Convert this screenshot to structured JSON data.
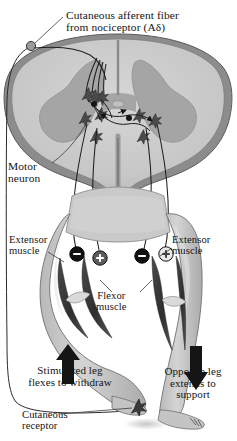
{
  "figure": {
    "background_color": "#ffffff"
  },
  "labels": {
    "afferent_fiber": "Cutaneous afferent fiber\nfrom nociceptor (Aδ)",
    "motor_neuron": "Motor\nneuron",
    "extensor_muscle_left": "Extensor\nmuscle",
    "extensor_muscle_right": "Extensor\nmuscle",
    "flexor_muscle": "Flexor\nmuscle",
    "stimulated_leg": "Stimulated leg\nflexes to withdraw",
    "opposite_leg": "Opposite leg\nextends to\nsupport",
    "cutaneous_receptor": "Cutaneous\nreceptor"
  },
  "synapse_signs": {
    "left_inhibitory": "−",
    "left_excitatory": "+",
    "right_inhibitory": "−",
    "right_excitatory": "+"
  },
  "arrows": {
    "left_direction": "up",
    "right_direction": "down"
  },
  "colors": {
    "ink": "#151515",
    "white_matter": "#c9c9c9",
    "gray_matter": "#a9a9a9",
    "cord_outline": "#6e6e6e",
    "skin": "#c7c7c7",
    "muscle_dark": "#3d3d3d",
    "arrow": "#1a1a1a"
  },
  "anatomy": {
    "spinal_cord": "transverse section of spinal cord",
    "interneurons": "excitatory and inhibitory interneurons",
    "legs": [
      "flexed withdrawing leg",
      "extended supporting leg"
    ]
  }
}
